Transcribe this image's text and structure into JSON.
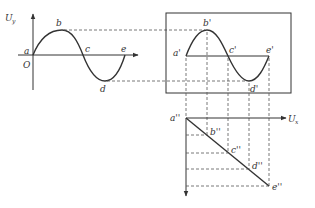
{
  "diagram": {
    "type": "oscilloscope-sweep-construction",
    "colors": {
      "line": "#333333",
      "dash": "#555555",
      "background": "#ffffff"
    },
    "left_graph": {
      "y_axis_label": "U",
      "y_axis_subscript": "y",
      "origin_label": "O",
      "points": [
        {
          "label": "a",
          "x": 33,
          "y": 55
        },
        {
          "label": "b",
          "x": 62,
          "y": 30
        },
        {
          "label": "c",
          "x": 83,
          "y": 55
        },
        {
          "label": "d",
          "x": 105,
          "y": 81
        },
        {
          "label": "e",
          "x": 125,
          "y": 55
        }
      ]
    },
    "screen": {
      "points": [
        {
          "label": "a'",
          "x": 186,
          "y": 56
        },
        {
          "label": "b'",
          "x": 207,
          "y": 30
        },
        {
          "label": "c'",
          "x": 228,
          "y": 56
        },
        {
          "label": "d'",
          "x": 249,
          "y": 81
        },
        {
          "label": "e'",
          "x": 269,
          "y": 56
        }
      ]
    },
    "sweep_graph": {
      "x_axis_label": "U",
      "x_axis_subscript": "x",
      "points": [
        {
          "label": "a''",
          "x": 186,
          "y": 118
        },
        {
          "label": "b''",
          "x": 207,
          "y": 135
        },
        {
          "label": "c''",
          "x": 228,
          "y": 153
        },
        {
          "label": "d''",
          "x": 249,
          "y": 169
        },
        {
          "label": "e''",
          "x": 269,
          "y": 186
        }
      ]
    }
  }
}
